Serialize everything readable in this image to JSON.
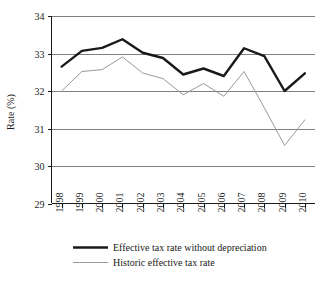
{
  "chart_data": {
    "type": "line",
    "title": "",
    "xlabel": "",
    "ylabel": "Rate (%)",
    "categories": [
      "1998",
      "1999",
      "2000",
      "2001",
      "2002",
      "2003",
      "2004",
      "2005",
      "2006",
      "2007",
      "2008",
      "2009",
      "2010"
    ],
    "ylim": [
      29,
      34
    ],
    "yticks": [
      "29",
      "30",
      "31",
      "32",
      "33",
      "34"
    ],
    "ytick_values": [
      29,
      30,
      31,
      32,
      33,
      34
    ],
    "grid": true,
    "legend_position": "bottom",
    "series": [
      {
        "name": "Effective tax rate without depreciation",
        "color": "#1a1a1a",
        "width": 2.4,
        "values": [
          32.65,
          33.07,
          33.15,
          33.38,
          33.02,
          32.88,
          32.44,
          32.6,
          32.4,
          33.14,
          32.93,
          32.0,
          32.47
        ]
      },
      {
        "name": "Historic effective tax rate",
        "color": "#999999",
        "width": 1.0,
        "values": [
          32.0,
          32.52,
          32.57,
          32.91,
          32.48,
          32.33,
          31.9,
          32.2,
          31.86,
          32.52,
          31.55,
          30.55,
          31.23
        ]
      }
    ]
  },
  "legend": {
    "items": [
      {
        "label": "Effective tax rate without depreciation"
      },
      {
        "label": "Historic effective tax rate"
      }
    ]
  },
  "axes": {
    "y_title": "Rate (%)"
  }
}
